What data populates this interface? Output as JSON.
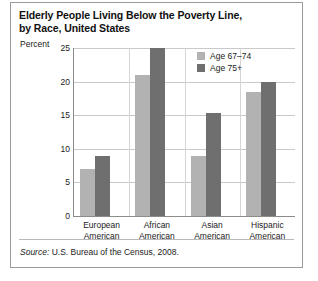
{
  "title": {
    "line1": "Elderly People Living Below the Poverty Line,",
    "line2": "by Race, United States"
  },
  "axis": {
    "y_label": "Percent",
    "y_ticks": [
      "25",
      "20",
      "15",
      "10",
      "5",
      "0"
    ]
  },
  "legend": {
    "items": [
      {
        "label": "Age 67–74",
        "color": "#b2b2b2",
        "swatch": "legend-swatch-light"
      },
      {
        "label": "Age 75+",
        "color": "#6f6f6f",
        "swatch": "legend-swatch-dark"
      }
    ]
  },
  "source": {
    "prefix": "Source:",
    "text": " U.S. Bureau of the Census, 2008."
  },
  "categories_display": [
    {
      "l1": "European",
      "l2": "American"
    },
    {
      "l1": "African",
      "l2": "American"
    },
    {
      "l1": "Asian",
      "l2": "American"
    },
    {
      "l1": "Hispanic",
      "l2": "American"
    }
  ],
  "chart_data": {
    "type": "bar",
    "title": "Elderly People Living Below the Poverty Line, by Race, United States",
    "subtitle": "",
    "xlabel": "",
    "ylabel": "Percent",
    "ylim": [
      0,
      25
    ],
    "yticks": [
      0,
      5,
      10,
      15,
      20,
      25
    ],
    "grid": true,
    "legend_position": "top-right",
    "source": "Source: U.S. Bureau of the Census, 2008.",
    "categories": [
      "European American",
      "African American",
      "Asian American",
      "Hispanic American"
    ],
    "series": [
      {
        "name": "Age 67–74",
        "color": "#b2b2b2",
        "values": [
          7,
          21,
          9,
          18.5
        ]
      },
      {
        "name": "Age 75+",
        "color": "#6f6f6f",
        "values": [
          9,
          25,
          15.3,
          20
        ]
      }
    ]
  }
}
